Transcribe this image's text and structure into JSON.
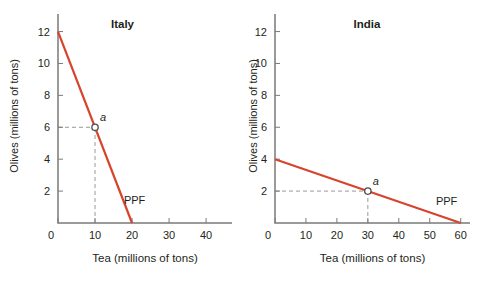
{
  "colors": {
    "ppf_line": "#d8432c",
    "dashed_guide": "#999999",
    "axis": "#7a7a7a",
    "text": "#231f20",
    "marker_fill": "#ffffff",
    "marker_stroke": "#4a4a4a"
  },
  "chart_data": [
    {
      "type": "line",
      "title": "Italy",
      "xlabel": "Tea (millions of tons)",
      "ylabel": "Olives (millions of tons)",
      "xlim": [
        0,
        47
      ],
      "ylim": [
        0,
        13.1
      ],
      "xticks": [
        0,
        10,
        20,
        30,
        40
      ],
      "yticks": [
        2,
        4,
        6,
        8,
        10,
        12
      ],
      "grid": false,
      "series": [
        {
          "name": "PPF",
          "points": [
            [
              0,
              12
            ],
            [
              20,
              0
            ]
          ]
        }
      ],
      "curve_label": {
        "text": "PPF",
        "x": 17.8,
        "y": 1.2
      },
      "point": {
        "label": "a",
        "x": 10,
        "y": 6
      }
    },
    {
      "type": "line",
      "title": "India",
      "xlabel": "Tea (millions of tons)",
      "ylabel": "Olives (millions of tons)",
      "xlim": [
        0,
        63
      ],
      "ylim": [
        0,
        13.1
      ],
      "xticks": [
        0,
        10,
        20,
        30,
        40,
        50,
        60
      ],
      "yticks": [
        2,
        4,
        6,
        8,
        10,
        12
      ],
      "grid": false,
      "series": [
        {
          "name": "PPF",
          "points": [
            [
              0,
              4
            ],
            [
              60,
              0
            ]
          ]
        }
      ],
      "curve_label": {
        "text": "PPF",
        "x": 52,
        "y": 1.1
      },
      "point": {
        "label": "a",
        "x": 30,
        "y": 2
      }
    }
  ]
}
